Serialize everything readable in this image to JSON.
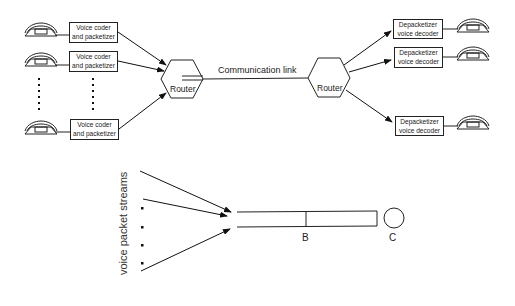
{
  "figure": {
    "top_network": {
      "senders": [
        {
          "label_line1": "Voice coder",
          "label_line2": "and packetizer"
        },
        {
          "label_line1": "Voice coder",
          "label_line2": "and packetizer"
        },
        {
          "label_line1": "Voice coder",
          "label_line2": "and packetizer"
        }
      ],
      "ingress_router": {
        "label": "Router"
      },
      "link": {
        "label": "Communication link"
      },
      "egress_router": {
        "label": "Router"
      },
      "receivers": [
        {
          "label_line1": "Depacketizer",
          "label_line2": "voice decoder"
        },
        {
          "label_line1": "Depacketizer",
          "label_line2": "voice decoder"
        },
        {
          "label_line1": "Depacketizer",
          "label_line2": "voice decoder"
        }
      ],
      "icons": {
        "endpoint": "telephone-icon",
        "router": "hexagon-router-icon"
      }
    },
    "queue_model": {
      "streams_label": "voice packet streams",
      "buffer_label": "B",
      "server_label": "C"
    }
  }
}
